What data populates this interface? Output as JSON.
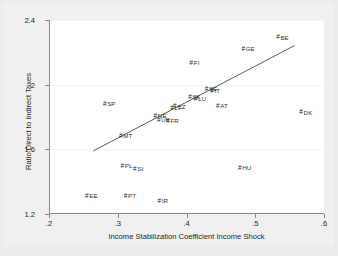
{
  "chart_data": {
    "type": "scatter",
    "title": "",
    "xlabel": "Income Stabilization Coefficient Income Shock",
    "ylabel": "Ratio Direct to Indirect Taxes",
    "xlim": [
      0.2,
      0.6
    ],
    "ylim": [
      1.2,
      2.4
    ],
    "xticks": [
      ".2",
      ".3",
      ".4",
      ".5",
      ".6"
    ],
    "xtick_values": [
      0.2,
      0.3,
      0.4,
      0.5,
      0.6
    ],
    "yticks": [
      "1.2",
      "1.6",
      "2",
      "2.4"
    ],
    "ytick_values": [
      1.2,
      1.6,
      2.0,
      2.4
    ],
    "grid": "horizontal-faint",
    "legend": "none",
    "marker_glyph": "#",
    "points": [
      {
        "label": "BE",
        "x": 0.528,
        "y": 2.293
      },
      {
        "label": "GE",
        "x": 0.478,
        "y": 2.222
      },
      {
        "label": "FI",
        "x": 0.4,
        "y": 2.137
      },
      {
        "label": "DK",
        "x": 0.562,
        "y": 1.829
      },
      {
        "label": "AT",
        "x": 0.44,
        "y": 1.872
      },
      {
        "label": "SP",
        "x": 0.276,
        "y": 1.882
      },
      {
        "label": "SE",
        "x": 0.424,
        "y": 1.975
      },
      {
        "label": "IT",
        "x": 0.43,
        "y": 1.963
      },
      {
        "label": "SK",
        "x": 0.4,
        "y": 1.924
      },
      {
        "label": "LU",
        "x": 0.408,
        "y": 1.911
      },
      {
        "label": "CZ",
        "x": 0.378,
        "y": 1.866
      },
      {
        "label": "LT",
        "x": 0.373,
        "y": 1.858
      },
      {
        "label": "NE",
        "x": 0.35,
        "y": 1.808
      },
      {
        "label": "UK",
        "x": 0.355,
        "y": 1.784
      },
      {
        "label": "FR",
        "x": 0.368,
        "y": 1.779
      },
      {
        "label": "MT",
        "x": 0.3,
        "y": 1.681
      },
      {
        "label": "PL",
        "x": 0.301,
        "y": 1.5
      },
      {
        "label": "SI",
        "x": 0.318,
        "y": 1.481
      },
      {
        "label": "HU",
        "x": 0.473,
        "y": 1.487
      },
      {
        "label": "EE",
        "x": 0.25,
        "y": 1.313
      },
      {
        "label": "PT",
        "x": 0.306,
        "y": 1.313
      },
      {
        "label": "IR",
        "x": 0.354,
        "y": 1.28
      }
    ],
    "fit_line": {
      "name": "fitted-regression-line",
      "x_start": 0.263,
      "y_start": 1.586,
      "x_end": 0.557,
      "y_end": 2.241
    }
  }
}
